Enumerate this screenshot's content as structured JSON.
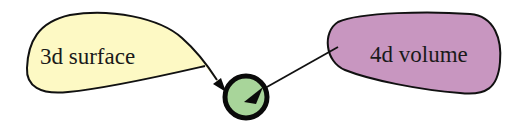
{
  "diagram": {
    "nodes": [
      {
        "id": "surface",
        "label": "3d surface",
        "shape": "teardrop",
        "fill": "#fdf9c4",
        "stroke": "#111111"
      },
      {
        "id": "volume",
        "label": "4d volume",
        "shape": "blob",
        "fill": "#c896c0",
        "stroke": "#111111"
      },
      {
        "id": "target",
        "label": "",
        "shape": "circle",
        "fill": "#a8d59a",
        "stroke": "#0a0a0a"
      }
    ],
    "edges": [
      {
        "from": "surface",
        "to": "target",
        "arrow": "triangle"
      },
      {
        "from": "volume",
        "to": "target",
        "arrow": "triangle"
      }
    ]
  }
}
